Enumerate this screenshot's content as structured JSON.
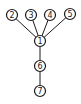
{
  "diagram": {
    "type": "tree",
    "nodes": [
      {
        "id": "1",
        "label": "1",
        "x": 40,
        "y": 41
      },
      {
        "id": "2",
        "label": "2",
        "x": 12,
        "y": 15
      },
      {
        "id": "3",
        "label": "3",
        "x": 31,
        "y": 15
      },
      {
        "id": "4",
        "label": "4",
        "x": 50,
        "y": 15
      },
      {
        "id": "5",
        "label": "5",
        "x": 70,
        "y": 14
      },
      {
        "id": "6",
        "label": "6",
        "x": 40,
        "y": 66
      },
      {
        "id": "7",
        "label": "7",
        "x": 40,
        "y": 91
      }
    ],
    "edges": [
      {
        "from": "1",
        "to": "2"
      },
      {
        "from": "1",
        "to": "3"
      },
      {
        "from": "1",
        "to": "4"
      },
      {
        "from": "1",
        "to": "5"
      },
      {
        "from": "1",
        "to": "6"
      },
      {
        "from": "6",
        "to": "7"
      }
    ],
    "node_radius": 5.5,
    "colors": {
      "stroke": "#1a1a1a",
      "fill": "#ffffff"
    }
  }
}
